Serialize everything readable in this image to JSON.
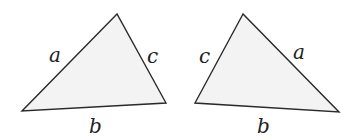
{
  "diagram": {
    "fill_color": "#f3f3f3",
    "stroke_color": "#2a2a2a",
    "triangles": [
      {
        "name": "left",
        "points": "117,14 22,111 166,103",
        "labels": [
          {
            "text": "a",
            "x": 49,
            "y": 62
          },
          {
            "text": "c",
            "x": 147,
            "y": 63
          },
          {
            "text": "b",
            "x": 89,
            "y": 133
          }
        ]
      },
      {
        "name": "right",
        "points": "243,14 195,103 339,112",
        "labels": [
          {
            "text": "c",
            "x": 199,
            "y": 63
          },
          {
            "text": "a",
            "x": 293,
            "y": 59
          },
          {
            "text": "b",
            "x": 257,
            "y": 133
          }
        ]
      }
    ]
  }
}
